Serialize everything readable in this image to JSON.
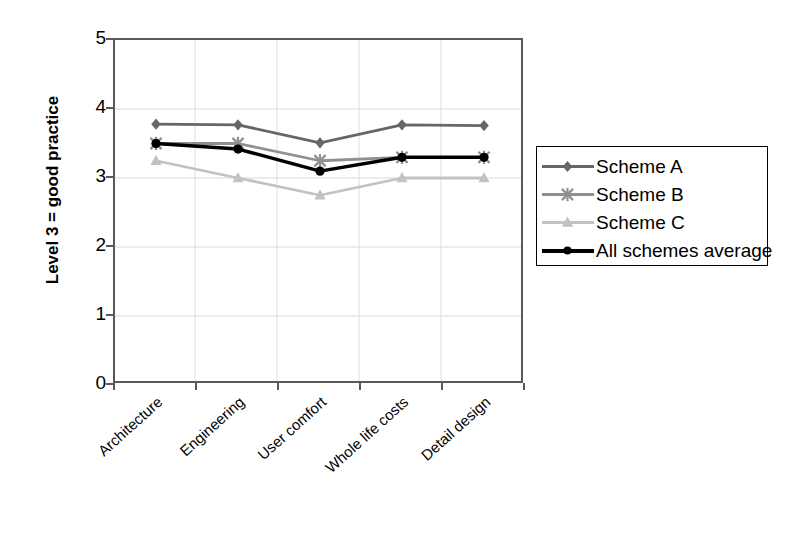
{
  "chart_data": {
    "type": "line",
    "title": "",
    "xlabel": "",
    "ylabel": "Level 3 = good practice",
    "categories": [
      "Architecture",
      "Engineering",
      "User comfort",
      "Whole life costs",
      "Detail design"
    ],
    "ylim": [
      0,
      5
    ],
    "yticks": [
      0,
      1,
      2,
      3,
      4,
      5
    ],
    "grid": true,
    "legend_position": "right",
    "series": [
      {
        "name": "Scheme A",
        "color": "#666666",
        "marker": "diamond",
        "values": [
          3.78,
          3.77,
          3.51,
          3.77,
          3.76
        ]
      },
      {
        "name": "Scheme B",
        "color": "#909090",
        "marker": "cross",
        "values": [
          3.5,
          3.5,
          3.25,
          3.3,
          3.3
        ]
      },
      {
        "name": "Scheme C",
        "color": "#c2c2c2",
        "marker": "triangle",
        "values": [
          3.25,
          3.0,
          2.75,
          3.0,
          3.0
        ]
      },
      {
        "name": "All schemes average",
        "color": "#000000",
        "marker": "circle",
        "values": [
          3.5,
          3.42,
          3.1,
          3.3,
          3.3
        ]
      }
    ]
  },
  "axes": {
    "y_tick_labels": [
      "5",
      "4",
      "3",
      "2",
      "1",
      "0"
    ],
    "y_title": "Level 3 = good practice"
  },
  "legend": {
    "items": [
      {
        "label": "Scheme A"
      },
      {
        "label": "Scheme B"
      },
      {
        "label": "Scheme C"
      },
      {
        "label": "All schemes average"
      }
    ]
  }
}
